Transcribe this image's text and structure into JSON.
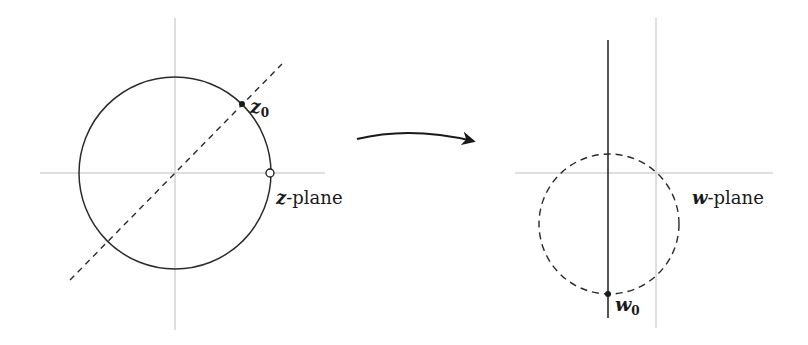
{
  "figure": {
    "left_panel": {
      "label_var": "z",
      "label_suffix": "-plane",
      "point_label_var": "z",
      "point_label_sub": "0"
    },
    "right_panel": {
      "label_var": "w",
      "label_suffix": "-plane",
      "point_label_var": "w",
      "point_label_sub": "0"
    },
    "colors": {
      "axis": "#b8b8b8",
      "curve": "#2a2a2a"
    }
  }
}
